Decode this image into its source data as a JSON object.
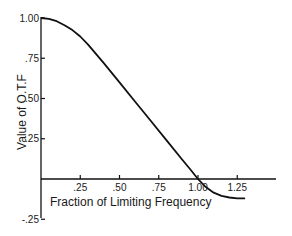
{
  "chart_data": {
    "type": "line",
    "title": "",
    "xlabel": "Fraction of Limiting Frequency",
    "ylabel": "Value of O.T.F",
    "xlim": [
      0,
      1.45
    ],
    "ylim": [
      -0.25,
      1.0
    ],
    "grid": false,
    "legend": null,
    "x_ticks": [
      ".25",
      ".50",
      ".75",
      "1.00",
      "1.25"
    ],
    "y_ticks": [
      "1.00",
      ".75",
      ".50",
      ".25",
      "-.25"
    ],
    "series": [
      {
        "name": "O.T.F",
        "color": "#111111",
        "x": [
          0.0,
          0.05,
          0.1,
          0.15,
          0.2,
          0.25,
          0.3,
          0.4,
          0.5,
          0.6,
          0.7,
          0.8,
          0.9,
          0.95,
          1.0,
          1.05,
          1.1,
          1.15,
          1.2,
          1.25,
          1.3
        ],
        "y": [
          1.0,
          0.995,
          0.98,
          0.955,
          0.925,
          0.885,
          0.835,
          0.72,
          0.6,
          0.48,
          0.36,
          0.24,
          0.12,
          0.06,
          0.0,
          -0.05,
          -0.085,
          -0.105,
          -0.115,
          -0.12,
          -0.12
        ]
      }
    ]
  }
}
